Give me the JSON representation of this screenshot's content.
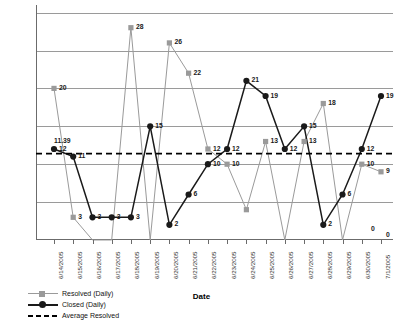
{
  "chart_data": {
    "type": "line",
    "title": "",
    "xlabel": "Date",
    "ylabel": "",
    "ylim": [
      0,
      31
    ],
    "grid": true,
    "gridlines": [
      5,
      10,
      15,
      20,
      25,
      30
    ],
    "legend_position": "bottom-left",
    "categories": [
      "6/14/2005",
      "6/15/2005",
      "6/16/2005",
      "6/17/2005",
      "6/18/2005",
      "6/19/2005",
      "6/20/2005",
      "6/21/2005",
      "6/22/2005",
      "6/23/2005",
      "6/24/2005",
      "6/25/2005",
      "6/26/2005",
      "6/27/2005",
      "6/28/2005",
      "6/29/2005",
      "6/30/2005",
      "7/1/2005"
    ],
    "series": [
      {
        "name": "Resolved (Daily)",
        "marker": "square",
        "color": "#9a9a9a",
        "values": [
          20,
          3,
          0,
          0,
          28,
          0,
          26,
          22,
          12,
          10,
          4,
          13,
          0,
          13,
          18,
          0,
          10,
          9
        ],
        "labels": [
          "20",
          "3",
          "",
          "",
          "28",
          "",
          "26",
          "22",
          "12",
          "10",
          "",
          "13",
          "",
          "13",
          "18",
          "",
          "10",
          "9"
        ]
      },
      {
        "name": "Closed (Daily)",
        "marker": "circle",
        "color": "#1a1a1a",
        "values": [
          12,
          11,
          3,
          3,
          3,
          15,
          2,
          6,
          10,
          12,
          21,
          19,
          12,
          15,
          2,
          6,
          12,
          19
        ],
        "labels": [
          "12",
          "11",
          "3",
          "3",
          "3",
          "15",
          "2",
          "6",
          "10",
          "12",
          "21",
          "19",
          "12",
          "15",
          "2",
          "6",
          "12",
          "19"
        ]
      }
    ],
    "reference_line": {
      "name": "Average Resolved",
      "value": 11.39,
      "label": "11.39",
      "style": "dashed",
      "color": "#000000"
    },
    "extra_point_labels": [
      {
        "text": "0",
        "series": "Closed (Daily)",
        "category": "7/1/2005"
      },
      {
        "text": "0",
        "series": "Resolved (Daily)",
        "category": "7/1/2005"
      }
    ]
  },
  "legend": {
    "items": [
      {
        "label": "Resolved (Daily)",
        "key": "square-line-key",
        "color": "#9a9a9a"
      },
      {
        "label": "Closed (Daily)",
        "key": "circle-line-key",
        "color": "#1a1a1a"
      },
      {
        "label": "Average Resolved",
        "key": "dashed-line-key",
        "color": "#000000"
      }
    ]
  },
  "axis": {
    "x_title": "Date"
  }
}
